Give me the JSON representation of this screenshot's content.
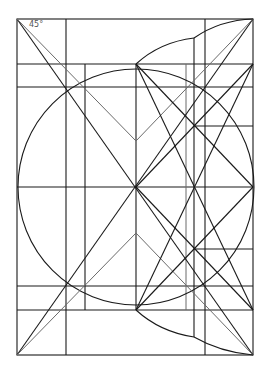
{
  "diagram": {
    "angle_label": "45°",
    "colors": {
      "background": "#ffffff",
      "primary_line": "#1a1a1a",
      "secondary_line": "#6a6a6a"
    },
    "frame": {
      "left": 17,
      "top": 19,
      "right": 253,
      "bottom": 355
    },
    "center": [
      136,
      187
    ],
    "horizontal_lines_y": [
      64,
      87,
      187,
      286,
      310
    ],
    "vertical_lines_x": [
      66,
      85,
      136,
      186,
      194,
      205
    ],
    "circle": {
      "cx": 136,
      "cy": 187,
      "r": 118
    }
  }
}
